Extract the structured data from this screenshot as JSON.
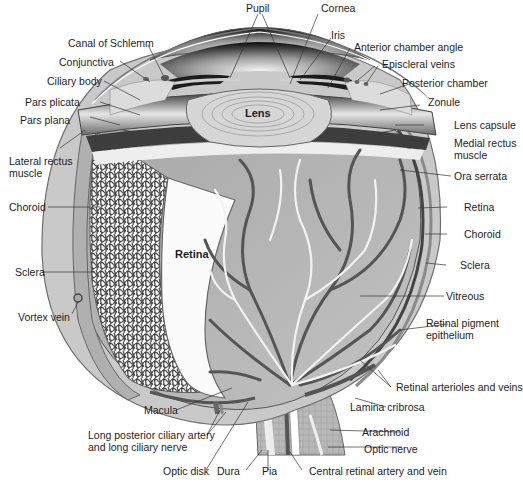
{
  "diagram": {
    "inner_labels": {
      "lens": "Lens",
      "retina_panel": "Retina"
    },
    "labels_top": [
      {
        "id": "pupil",
        "text": "Pupil"
      },
      {
        "id": "cornea",
        "text": "Cornea"
      }
    ],
    "labels_left": [
      {
        "id": "canal_of_schlemm",
        "text": "Canal of Schlemm"
      },
      {
        "id": "conjunctiva",
        "text": "Conjunctiva"
      },
      {
        "id": "ciliary_body",
        "text": "Ciliary body"
      },
      {
        "id": "pars_plicata",
        "text": "Pars plicata"
      },
      {
        "id": "pars_plana",
        "text": "Pars plana"
      },
      {
        "id": "lateral_rectus_muscle",
        "text": "Lateral rectus",
        "text2": "muscle"
      },
      {
        "id": "choroid_left",
        "text": "Choroid"
      },
      {
        "id": "sclera_left",
        "text": "Sclera"
      },
      {
        "id": "vortex_vein",
        "text": "Vortex vein"
      }
    ],
    "labels_right": [
      {
        "id": "iris",
        "text": "Iris"
      },
      {
        "id": "anterior_chamber_angle",
        "text": "Anterior chamber angle"
      },
      {
        "id": "episcleral_veins",
        "text": "Episcleral veins"
      },
      {
        "id": "posterior_chamber",
        "text": "Posterior chamber"
      },
      {
        "id": "zonule",
        "text": "Zonule"
      },
      {
        "id": "lens_capsule",
        "text": "Lens capsule"
      },
      {
        "id": "medial_rectus_muscle",
        "text": "Medial rectus",
        "text2": "muscle"
      },
      {
        "id": "ora_serrata",
        "text": "Ora serrata"
      },
      {
        "id": "retina_right",
        "text": "Retina"
      },
      {
        "id": "choroid_right",
        "text": "Choroid"
      },
      {
        "id": "sclera_right",
        "text": "Sclera"
      },
      {
        "id": "vitreous",
        "text": "Vitreous"
      },
      {
        "id": "retinal_pigment_epithelium",
        "text": "Retinal pigment",
        "text2": "epithelium"
      },
      {
        "id": "retinal_arterioles_and_veins",
        "text": "Retinal arterioles and veins"
      },
      {
        "id": "lamina_cribrosa",
        "text": "Lamina cribrosa"
      },
      {
        "id": "arachnoid",
        "text": "Arachnoid"
      },
      {
        "id": "optic_nerve",
        "text": "Optic nerve"
      }
    ],
    "labels_bottom": [
      {
        "id": "macula",
        "text": "Macula"
      },
      {
        "id": "long_posterior_ciliary",
        "text": "Long posterior ciliary artery",
        "text2": "and long ciliary nerve"
      },
      {
        "id": "optic_disk",
        "text": "Optic disk"
      },
      {
        "id": "dura",
        "text": "Dura"
      },
      {
        "id": "pia",
        "text": "Pia"
      },
      {
        "id": "central_retinal_artery_and_vein",
        "text": "Central retinal artery and vein"
      }
    ],
    "colors": {
      "sclera": "#c9c9c9",
      "sclera_edge": "#6f6f6f",
      "retina_bg": "#b4b4b4",
      "vessel_dark": "#555555",
      "vessel_light": "#f2f2f2",
      "lens": "#d6d6d6",
      "chamber_dark": "#1c1c1c",
      "leader_line": "#333333"
    }
  }
}
